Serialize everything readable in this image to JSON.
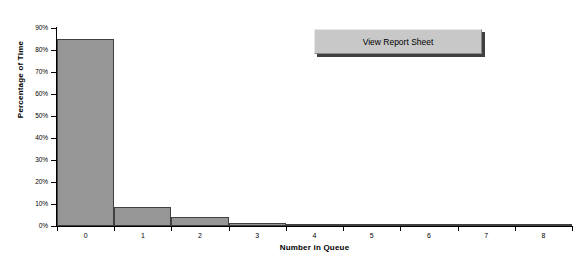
{
  "chart_data": {
    "type": "bar",
    "title": "",
    "xlabel": "Number in Queue",
    "ylabel": "Percentage of Time",
    "categories": [
      "0",
      "1",
      "2",
      "3",
      "4",
      "5",
      "6",
      "7",
      "8"
    ],
    "values": [
      85,
      8.5,
      4,
      1.3,
      0.3,
      0.1,
      0,
      0,
      0
    ],
    "ylim": [
      0,
      90
    ],
    "xlim": [
      0,
      8
    ],
    "ytick_labels": [
      "0%",
      "10%",
      "20%",
      "30%",
      "40%",
      "50%",
      "60%",
      "70%",
      "80%",
      "90%"
    ],
    "ytick_values": [
      0,
      10,
      20,
      30,
      40,
      50,
      60,
      70,
      80,
      90
    ],
    "xtick_labels": [
      "0",
      "1",
      "2",
      "3",
      "4",
      "5",
      "6",
      "7",
      "8"
    ],
    "grid": false,
    "legend": false,
    "bar_fill_color": "#969696",
    "bar_border_color": "#404040",
    "axis_color": "#000000"
  },
  "controls": {
    "report_button_label": "View Report Sheet"
  }
}
